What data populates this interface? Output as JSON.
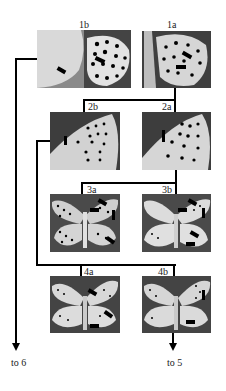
{
  "diagram": {
    "type": "identification-key",
    "nodes": [
      {
        "id": "1b",
        "label": "1b",
        "subject": "butterfly underside wing, composite (pale hindwing + spotted wing)",
        "markers": "black bar markers"
      },
      {
        "id": "1a",
        "label": "1a",
        "subject": "butterfly underside hindwing with dense spots",
        "markers": "black bar markers"
      },
      {
        "id": "2b",
        "label": "2b",
        "subject": "butterfly underside forewing, pale",
        "markers": "black bar marker"
      },
      {
        "id": "2a",
        "label": "2a",
        "subject": "butterfly underside forewing, spotted",
        "markers": "black bar marker"
      },
      {
        "id": "3a",
        "label": "3a",
        "subject": "butterfly underside, wings spread, heavily spotted",
        "markers": "black bar markers"
      },
      {
        "id": "3b",
        "label": "3b",
        "subject": "butterfly underside, wings spread, lightly spotted",
        "markers": "black bar markers"
      },
      {
        "id": "4a",
        "label": "4a",
        "subject": "butterfly underside, wings spread",
        "markers": "black bar markers"
      },
      {
        "id": "4b",
        "label": "4b",
        "subject": "butterfly underside, wings spread",
        "markers": "black bar markers"
      }
    ],
    "edges": [
      {
        "from": "1b",
        "to": "to 6"
      },
      {
        "from": "1a",
        "to": "2a"
      },
      {
        "from": "1a",
        "to": "2b"
      },
      {
        "from": "2b",
        "to": "4a"
      },
      {
        "from": "2b",
        "to": "4b"
      },
      {
        "from": "2a",
        "to": "3a"
      },
      {
        "from": "2a",
        "to": "3b"
      },
      {
        "from": "4b",
        "to": "to 5"
      }
    ],
    "destinations": {
      "left": "to 6",
      "right": "to 5"
    }
  },
  "colors": {
    "line": "#000000",
    "photo_bg": "#3a3a3a",
    "wing": "#d8d8d8"
  }
}
